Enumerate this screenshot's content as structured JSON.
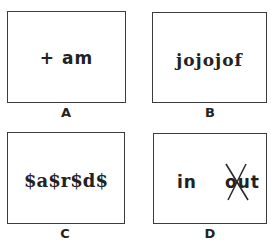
{
  "panels": [
    {
      "id": "A",
      "text": "+ am",
      "label": "A"
    },
    {
      "id": "B",
      "text": "jojojof",
      "label": "B"
    },
    {
      "id": "C",
      "text": "$a$r$d$",
      "label": "C"
    },
    {
      "id": "D",
      "text_left": "in",
      "text_right": "out",
      "crossed_out": "out",
      "label": "D"
    }
  ],
  "colors": {
    "border": "#3c3c3c",
    "text": "#222222",
    "background": "#ffffff"
  }
}
